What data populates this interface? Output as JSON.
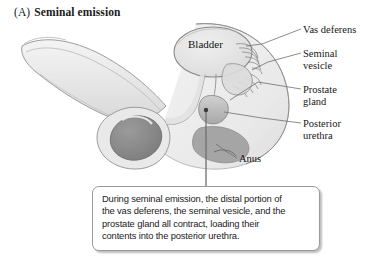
{
  "figure": {
    "panel_letter": "(A)",
    "title": "Seminal emission"
  },
  "labels": {
    "bladder": "Bladder",
    "vas_deferens": "Vas deferens",
    "seminal_vesicle": "Seminal\nvesicle",
    "prostate_gland": "Prostate\ngland",
    "posterior_urethra": "Posterior\nurethra",
    "anus": "Anus"
  },
  "caption": {
    "text": "During seminal emission, the distal portion of\nthe vas deferens, the seminal vesicle, and the\nprostate gland all contract, loading their\ncontents into the posterior urethra."
  },
  "colors": {
    "page_background": "#ffffff",
    "text": "#171717",
    "outline": "#8f8f8f",
    "leader_line": "#6f6f6f",
    "body_fill": "#ececec",
    "organ_fill": "#e3e3e3",
    "bladder_fill": "#e6e6e6",
    "testis_fill": "#8c8c8c",
    "prostate_fill": "#bdbdbd",
    "caption_border": "#9a9a9a",
    "caption_background": "#ffffff"
  }
}
